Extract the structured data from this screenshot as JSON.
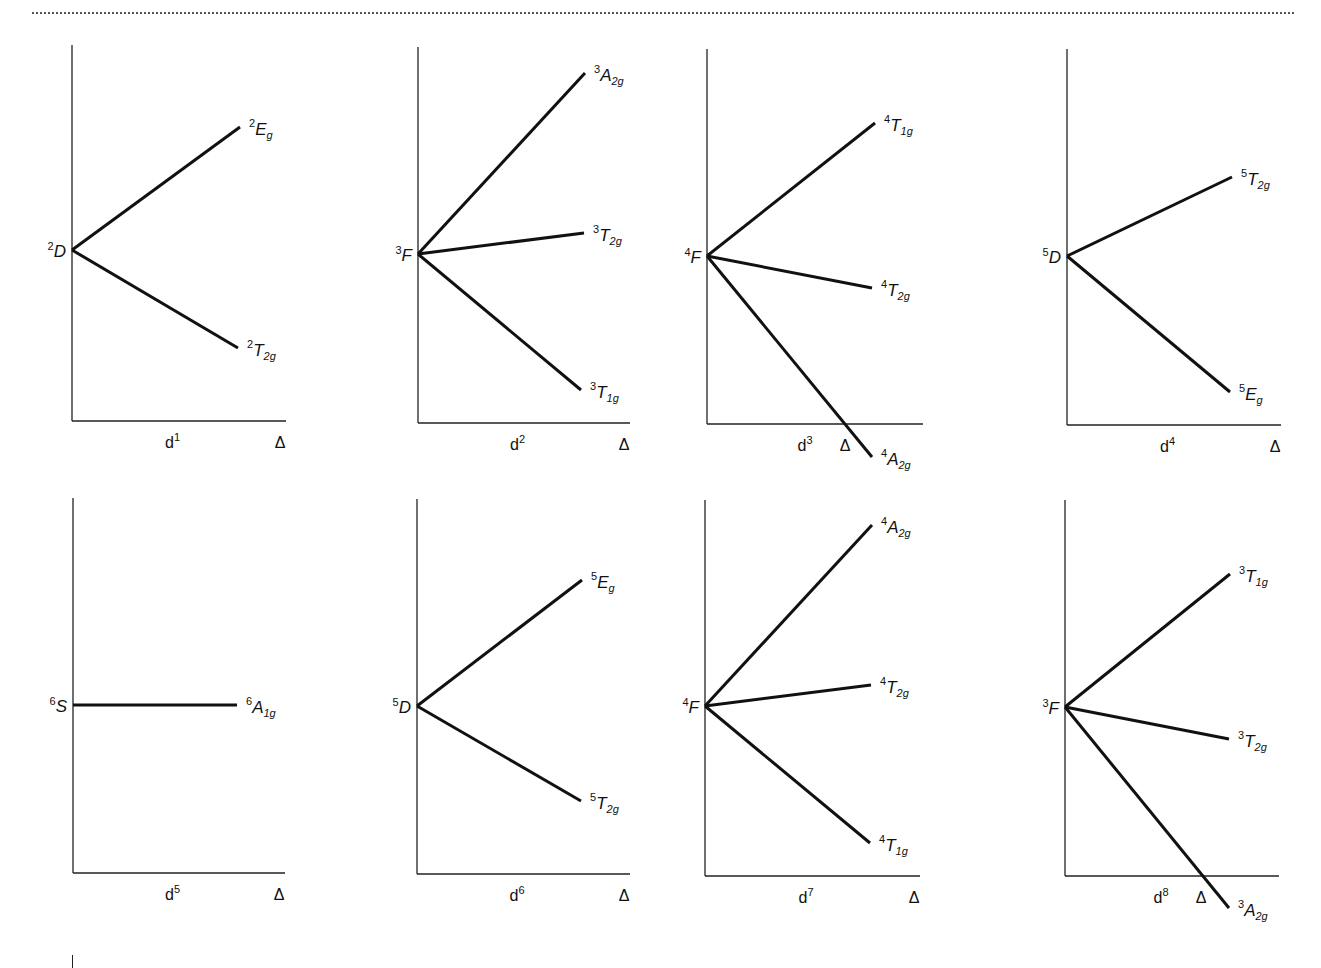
{
  "page": {
    "colors": {
      "line": "#111111",
      "axis": "#222222",
      "rule": "#555555",
      "background": "#ffffff"
    }
  },
  "axis_label_x": "Δ",
  "chart_data": [
    {
      "type": "line",
      "title": "d1",
      "config": "d",
      "config_sup": "1",
      "xlabel": "Δ",
      "free_ion": {
        "mult": "2",
        "term": "D"
      },
      "axis": {
        "x": 72,
        "top": 45,
        "bottom": 421,
        "right": 286
      },
      "origin": [
        72,
        250
      ],
      "series": [
        {
          "name": "2Eg",
          "mult": "2",
          "sym": "E",
          "sub": "g",
          "end": [
            240,
            127
          ],
          "direction": "up"
        },
        {
          "name": "2T2g",
          "mult": "2",
          "sym": "T",
          "sub": "2g",
          "end": [
            238,
            348
          ],
          "direction": "down"
        }
      ]
    },
    {
      "type": "line",
      "title": "d2",
      "config": "d",
      "config_sup": "2",
      "xlabel": "Δ",
      "free_ion": {
        "mult": "3",
        "term": "F"
      },
      "axis": {
        "x": 418,
        "top": 47,
        "bottom": 423,
        "right": 630
      },
      "origin": [
        418,
        254
      ],
      "series": [
        {
          "name": "3A2g",
          "mult": "3",
          "sym": "A",
          "sub": "2g",
          "end": [
            585,
            73
          ],
          "direction": "up"
        },
        {
          "name": "3T2g",
          "mult": "3",
          "sym": "T",
          "sub": "2g",
          "end": [
            584,
            233
          ],
          "direction": "up-slight"
        },
        {
          "name": "3T1g",
          "mult": "3",
          "sym": "T",
          "sub": "1g",
          "end": [
            581,
            390
          ],
          "direction": "down"
        }
      ]
    },
    {
      "type": "line",
      "title": "d3",
      "config": "d",
      "config_sup": "3",
      "xlabel": "Δ",
      "free_ion": {
        "mult": "4",
        "term": "F"
      },
      "axis": {
        "x": 707,
        "top": 49,
        "bottom": 424,
        "right": 923
      },
      "origin": [
        707,
        256
      ],
      "delta_label_pos": [
        845,
        452
      ],
      "series": [
        {
          "name": "4T1g",
          "mult": "4",
          "sym": "T",
          "sub": "1g",
          "end": [
            875,
            123
          ],
          "direction": "up"
        },
        {
          "name": "4T2g",
          "mult": "4",
          "sym": "T",
          "sub": "2g",
          "end": [
            872,
            288
          ],
          "direction": "down-slight"
        },
        {
          "name": "4A2g",
          "mult": "4",
          "sym": "A",
          "sub": "2g",
          "end": [
            872,
            457
          ],
          "direction": "down"
        }
      ]
    },
    {
      "type": "line",
      "title": "d4",
      "config": "d",
      "config_sup": "4",
      "xlabel": "Δ",
      "free_ion": {
        "mult": "5",
        "term": "D"
      },
      "axis": {
        "x": 1067,
        "top": 49,
        "bottom": 425,
        "right": 1281
      },
      "origin": [
        1067,
        256
      ],
      "series": [
        {
          "name": "5T2g",
          "mult": "5",
          "sym": "T",
          "sub": "2g",
          "end": [
            1232,
            177
          ],
          "direction": "up"
        },
        {
          "name": "5Eg",
          "mult": "5",
          "sym": "E",
          "sub": "g",
          "end": [
            1230,
            392
          ],
          "direction": "down"
        }
      ]
    },
    {
      "type": "line",
      "title": "d5",
      "config": "d",
      "config_sup": "5",
      "xlabel": "Δ",
      "free_ion": {
        "mult": "6",
        "term": "S"
      },
      "axis": {
        "x": 73,
        "top": 498,
        "bottom": 873,
        "right": 285
      },
      "origin": [
        73,
        705
      ],
      "series": [
        {
          "name": "6A1g",
          "mult": "6",
          "sym": "A",
          "sub": "1g",
          "end": [
            237,
            705
          ],
          "direction": "flat"
        }
      ]
    },
    {
      "type": "line",
      "title": "d6",
      "config": "d",
      "config_sup": "6",
      "xlabel": "Δ",
      "free_ion": {
        "mult": "5",
        "term": "D"
      },
      "axis": {
        "x": 417,
        "top": 499,
        "bottom": 874,
        "right": 630
      },
      "origin": [
        417,
        706
      ],
      "series": [
        {
          "name": "5Eg",
          "mult": "5",
          "sym": "E",
          "sub": "g",
          "end": [
            582,
            580
          ],
          "direction": "up"
        },
        {
          "name": "5T2g",
          "mult": "5",
          "sym": "T",
          "sub": "2g",
          "end": [
            581,
            801
          ],
          "direction": "down"
        }
      ]
    },
    {
      "type": "line",
      "title": "d7",
      "config": "d",
      "config_sup": "7",
      "xlabel": "Δ",
      "free_ion": {
        "mult": "4",
        "term": "F"
      },
      "axis": {
        "x": 705,
        "top": 500,
        "bottom": 876,
        "right": 920
      },
      "origin": [
        705,
        706
      ],
      "series": [
        {
          "name": "4A2g",
          "mult": "4",
          "sym": "A",
          "sub": "2g",
          "end": [
            872,
            525
          ],
          "direction": "up"
        },
        {
          "name": "4T2g",
          "mult": "4",
          "sym": "T",
          "sub": "2g",
          "end": [
            871,
            685
          ],
          "direction": "up-slight"
        },
        {
          "name": "4T1g",
          "mult": "4",
          "sym": "T",
          "sub": "1g",
          "end": [
            870,
            843
          ],
          "direction": "down"
        }
      ]
    },
    {
      "type": "line",
      "title": "d8",
      "config": "d",
      "config_sup": "8",
      "xlabel": "Δ",
      "free_ion": {
        "mult": "3",
        "term": "F"
      },
      "axis": {
        "x": 1065,
        "top": 500,
        "bottom": 876,
        "right": 1279
      },
      "origin": [
        1065,
        707
      ],
      "delta_label_pos": [
        1201,
        904
      ],
      "series": [
        {
          "name": "3T1g",
          "mult": "3",
          "sym": "T",
          "sub": "1g",
          "end": [
            1230,
            574
          ],
          "direction": "up"
        },
        {
          "name": "3T2g",
          "mult": "3",
          "sym": "T",
          "sub": "2g",
          "end": [
            1229,
            739
          ],
          "direction": "down-slight"
        },
        {
          "name": "3A2g",
          "mult": "3",
          "sym": "A",
          "sub": "2g",
          "end": [
            1229,
            908
          ],
          "direction": "down"
        }
      ]
    }
  ]
}
